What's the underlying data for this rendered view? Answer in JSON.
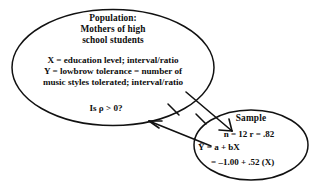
{
  "figure": {
    "type": "statistical-inference-diagram",
    "background_color": "#ffffff",
    "stroke_color": "#111111",
    "text_color": "#0d0d0d"
  },
  "population": {
    "title_line1": "Population:",
    "title_line2": "Mothers of high",
    "title_line3": "school students",
    "variable_x": "X = education level; interval/ratio",
    "variable_y_line1": "Y = lowbrow tolerance = number of",
    "variable_y_line2": "music styles tolerated; interval/ratio",
    "hypothesis": "Is ρ > 0?"
  },
  "sample": {
    "title": "Sample",
    "stats_line": "n = 12    r = .82",
    "regression_line1": "Ŷ = a + bX",
    "regression_line2": "= –1.00 + .52 (X)"
  },
  "connectors": {
    "arrow_to_sample": "inference-arrow-population-to-sample",
    "arrow_to_population": "inference-arrow-sample-to-population"
  }
}
